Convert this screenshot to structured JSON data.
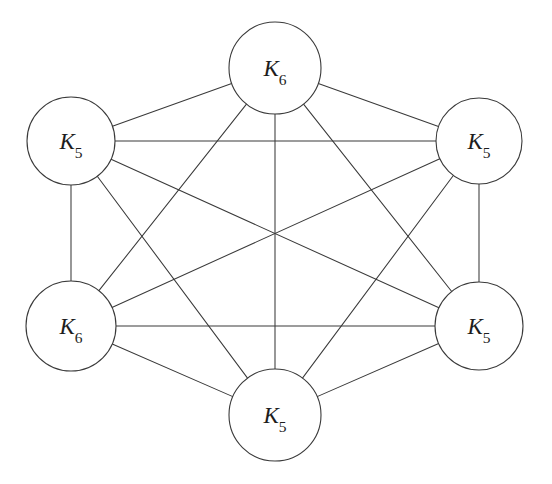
{
  "figure": {
    "background_color": "#ffffff",
    "stroke_color": "#3a3a3a",
    "label_color": "#1d1d1d",
    "width": 552,
    "height": 484
  },
  "nodes": [
    {
      "id": "top",
      "label": "K6",
      "label_base": "K",
      "label_sub": "6",
      "cx": 275,
      "cy": 68,
      "r": 46,
      "position_name": "top"
    },
    {
      "id": "upper-left",
      "label": "K5",
      "label_base": "K",
      "label_sub": "5",
      "cx": 71,
      "cy": 141,
      "r": 44,
      "position_name": "upper-left"
    },
    {
      "id": "upper-right",
      "label": "K5",
      "label_base": "K",
      "label_sub": "5",
      "cx": 479,
      "cy": 141,
      "r": 43,
      "position_name": "upper-right"
    },
    {
      "id": "lower-left",
      "label": "K6",
      "label_base": "K",
      "label_sub": "6",
      "cx": 71,
      "cy": 326,
      "r": 45,
      "position_name": "lower-left"
    },
    {
      "id": "lower-right",
      "label": "K5",
      "label_base": "K",
      "label_sub": "5",
      "cx": 479,
      "cy": 326,
      "r": 44,
      "position_name": "lower-right"
    },
    {
      "id": "bottom",
      "label": "K5",
      "label_base": "K",
      "label_sub": "5",
      "cx": 275,
      "cy": 415,
      "r": 46,
      "position_name": "bottom"
    }
  ],
  "edges": [
    {
      "from": "top",
      "to": "upper-left"
    },
    {
      "from": "top",
      "to": "upper-right"
    },
    {
      "from": "top",
      "to": "lower-left"
    },
    {
      "from": "top",
      "to": "lower-right"
    },
    {
      "from": "top",
      "to": "bottom"
    },
    {
      "from": "upper-left",
      "to": "upper-right"
    },
    {
      "from": "upper-left",
      "to": "lower-left"
    },
    {
      "from": "upper-left",
      "to": "lower-right"
    },
    {
      "from": "upper-left",
      "to": "bottom"
    },
    {
      "from": "upper-right",
      "to": "lower-left"
    },
    {
      "from": "upper-right",
      "to": "lower-right"
    },
    {
      "from": "upper-right",
      "to": "bottom"
    },
    {
      "from": "lower-left",
      "to": "lower-right"
    },
    {
      "from": "lower-left",
      "to": "bottom"
    },
    {
      "from": "lower-right",
      "to": "bottom"
    }
  ],
  "chart_data": {
    "type": "diagram",
    "graph_type": "complete-graph",
    "node_count": 6,
    "edge_count": 15,
    "node_labels": [
      "K6",
      "K5",
      "K5",
      "K6",
      "K5",
      "K5"
    ],
    "layout": "hexagonal-ring"
  }
}
